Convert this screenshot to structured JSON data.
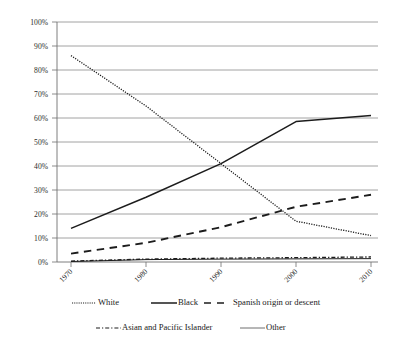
{
  "chart_data": {
    "type": "line",
    "title": "",
    "subtitle": "",
    "xlabel": "",
    "ylabel": "",
    "x": [
      1970,
      1980,
      1990,
      2000,
      2010
    ],
    "xtick_labels": [
      "1970",
      "1980",
      "1990",
      "2000",
      "2010"
    ],
    "ylim": [
      0,
      100
    ],
    "ytick_labels": [
      "0%",
      "10%",
      "20%",
      "30%",
      "40%",
      "50%",
      "60%",
      "70%",
      "80%",
      "90%",
      "100%"
    ],
    "ytick_values": [
      0,
      10,
      20,
      30,
      40,
      50,
      60,
      70,
      80,
      90,
      100
    ],
    "grid": "horizontal",
    "legend_position": "bottom",
    "units": "percent",
    "series": [
      {
        "name": "White",
        "line_style": "dotted",
        "color": "#1c1c1c",
        "values": [
          86,
          65,
          41,
          17,
          11
        ]
      },
      {
        "name": "Black",
        "line_style": "solid",
        "color": "#1c1c1c",
        "values": [
          14,
          27,
          41,
          58.5,
          61
        ]
      },
      {
        "name": "Spanish origin or descent",
        "line_style": "dashed",
        "color": "#1c1c1c",
        "values": [
          3.5,
          8,
          14.5,
          23,
          28
        ]
      },
      {
        "name": "Asian and Pacific Islander",
        "line_style": "dash-dot",
        "color": "#1c1c1c",
        "values": [
          0.4,
          1.2,
          1.6,
          1.8,
          2.1
        ]
      },
      {
        "name": "Other",
        "line_style": "solid-thin",
        "color": "#6f6f6f",
        "values": [
          0.2,
          1.0,
          1.2,
          1.3,
          1.4
        ]
      }
    ]
  },
  "legend": {
    "row1": [
      {
        "label": "White",
        "swatch": "dotted"
      },
      {
        "label": "Black",
        "swatch": "solid"
      },
      {
        "label": "Spanish origin or descent",
        "swatch": "dashed"
      }
    ],
    "row2": [
      {
        "label": "Asian and Pacific Islander",
        "swatch": "dash-dot"
      },
      {
        "label": "Other",
        "swatch": "solid-thin"
      }
    ]
  },
  "axes": {
    "y_labels": [
      "100%",
      "90%",
      "80%",
      "70%",
      "60%",
      "50%",
      "40%",
      "30%",
      "20%",
      "10%",
      "0%"
    ],
    "x_labels": [
      "1970",
      "1980",
      "1990",
      "2000",
      "2010"
    ]
  }
}
